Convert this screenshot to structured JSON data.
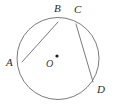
{
  "figure": {
    "name": "circle-with-inscribed-chords",
    "canvas": {
      "width": 115,
      "height": 110
    },
    "background_color": "#ffffff",
    "stroke_color": "#6b6b6b",
    "label_color": "#2b2b2b",
    "stroke_width": 0.9
  },
  "circle": {
    "center_x": 58,
    "center_y": 58.5,
    "radius": 41,
    "label": "circle"
  },
  "center_point": {
    "x": 57,
    "y": 56,
    "dot_radius": 1.6,
    "label": "O",
    "label_x": 46,
    "label_y": 59
  },
  "points": [
    {
      "id": "A",
      "label": "A",
      "x": 22,
      "y": 62,
      "label_x": 6,
      "label_y": 57
    },
    {
      "id": "B",
      "label": "B",
      "x": 58,
      "y": 22,
      "label_x": 54,
      "label_y": 3
    },
    {
      "id": "C",
      "label": "C",
      "x": 76,
      "y": 24,
      "label_x": 74,
      "label_y": 4
    },
    {
      "id": "D",
      "label": "D",
      "x": 93,
      "y": 82,
      "label_x": 97,
      "label_y": 84
    }
  ],
  "chords": [
    {
      "id": "AB",
      "from": "A",
      "to": "B",
      "x1": 22,
      "y1": 62,
      "x2": 58,
      "y2": 22
    },
    {
      "id": "CD",
      "from": "C",
      "to": "D",
      "x1": 76,
      "y1": 24,
      "x2": 93,
      "y2": 82
    }
  ],
  "chart_data": {
    "type": "diagram",
    "title": "",
    "shapes": [
      {
        "kind": "circle",
        "cx": 58,
        "cy": 58.5,
        "r": 41
      },
      {
        "kind": "dot",
        "cx": 57,
        "cy": 56,
        "r": 1.6
      },
      {
        "kind": "segment",
        "x1": 22,
        "y1": 62,
        "x2": 58,
        "y2": 22
      },
      {
        "kind": "segment",
        "x1": 76,
        "y1": 24,
        "x2": 93,
        "y2": 82
      }
    ],
    "labels": [
      "A",
      "B",
      "C",
      "D",
      "O"
    ]
  }
}
